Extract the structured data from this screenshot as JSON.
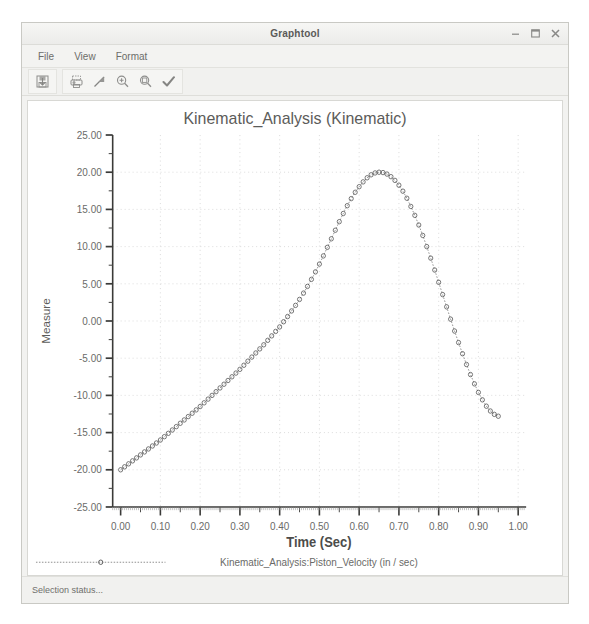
{
  "window": {
    "title": "Graphtool",
    "controls": [
      {
        "name": "minimize-button",
        "icon": "minimize-icon"
      },
      {
        "name": "maximize-button",
        "icon": "maximize-icon"
      },
      {
        "name": "close-button",
        "icon": "close-icon"
      }
    ]
  },
  "menubar": {
    "items": [
      {
        "label": "File"
      },
      {
        "label": "View"
      },
      {
        "label": "Format"
      }
    ]
  },
  "toolbar": {
    "buttons": [
      {
        "name": "save-plot-button",
        "icon": "save-icon"
      },
      {
        "name": "print-button",
        "icon": "printer-icon"
      },
      {
        "name": "trend-line-button",
        "icon": "trend-arrow-icon"
      },
      {
        "name": "zoom-in-button",
        "icon": "zoom-in-icon"
      },
      {
        "name": "zoom-out-button",
        "icon": "zoom-out-icon"
      },
      {
        "name": "apply-button",
        "icon": "checkmark-icon"
      }
    ]
  },
  "statusbar": {
    "text": "Selection status..."
  },
  "chart_data": {
    "type": "scatter",
    "title": "Kinematic_Analysis (Kinematic)",
    "xlabel": "Time (Sec)",
    "ylabel": "Measure",
    "xlim": [
      -0.02,
      1.02
    ],
    "ylim": [
      -25.0,
      25.0
    ],
    "xticks": [
      "0.00",
      "0.10",
      "0.20",
      "0.30",
      "0.40",
      "0.50",
      "0.60",
      "0.70",
      "0.80",
      "0.90",
      "1.00"
    ],
    "xtick_values": [
      0.0,
      0.1,
      0.2,
      0.3,
      0.4,
      0.5,
      0.6,
      0.7,
      0.8,
      0.9,
      1.0
    ],
    "yticks": [
      "25.00",
      "20.00",
      "15.00",
      "10.00",
      "5.00",
      "0.00",
      "-5.00",
      "-10.00",
      "-15.00",
      "-20.00",
      "-25.00"
    ],
    "ytick_values": [
      25,
      20,
      15,
      10,
      5,
      0,
      -5,
      -10,
      -15,
      -20,
      -25
    ],
    "grid": true,
    "minor_ticks": true,
    "legend_position": "bottom",
    "legend": [
      {
        "label": "Kinematic_Analysis:Piston_Velocity (in / sec)",
        "marker": "circle",
        "linestyle": "dotted",
        "color": "#555555"
      }
    ],
    "series": [
      {
        "name": "Kinematic_Analysis:Piston_Velocity (in / sec)",
        "marker": "circle",
        "color": "#555555",
        "x": [
          0.0,
          0.01,
          0.02,
          0.03,
          0.04,
          0.05,
          0.06,
          0.07,
          0.08,
          0.09,
          0.1,
          0.11,
          0.12,
          0.13,
          0.14,
          0.15,
          0.16,
          0.17,
          0.18,
          0.19,
          0.2,
          0.21,
          0.22,
          0.23,
          0.24,
          0.25,
          0.26,
          0.27,
          0.28,
          0.29,
          0.3,
          0.31,
          0.32,
          0.33,
          0.34,
          0.35,
          0.36,
          0.37,
          0.38,
          0.39,
          0.4,
          0.41,
          0.42,
          0.43,
          0.44,
          0.45,
          0.46,
          0.47,
          0.48,
          0.49,
          0.5,
          0.51,
          0.52,
          0.53,
          0.54,
          0.55,
          0.56,
          0.57,
          0.58,
          0.59,
          0.6,
          0.61,
          0.62,
          0.63,
          0.64,
          0.65,
          0.66,
          0.67,
          0.68,
          0.69,
          0.7,
          0.71,
          0.72,
          0.73,
          0.74,
          0.75,
          0.76,
          0.77,
          0.78,
          0.79,
          0.8,
          0.81,
          0.82,
          0.83,
          0.84,
          0.85,
          0.86,
          0.87,
          0.88,
          0.89,
          0.9,
          0.91,
          0.92,
          0.93,
          0.94,
          0.95
        ],
        "y": [
          -20.0,
          -19.6,
          -19.2,
          -18.8,
          -18.4,
          -18.0,
          -17.6,
          -17.2,
          -16.8,
          -16.4,
          -16.0,
          -15.55,
          -15.1,
          -14.65,
          -14.2,
          -13.75,
          -13.3,
          -12.85,
          -12.4,
          -11.95,
          -11.5,
          -11.0,
          -10.5,
          -10.0,
          -9.5,
          -9.0,
          -8.5,
          -8.0,
          -7.5,
          -7.0,
          -6.5,
          -5.95,
          -5.4,
          -4.85,
          -4.3,
          -3.75,
          -3.2,
          -2.6,
          -2.0,
          -1.4,
          -0.8,
          -0.1,
          0.6,
          1.35,
          2.1,
          2.9,
          3.75,
          4.65,
          5.6,
          6.6,
          7.65,
          8.75,
          9.9,
          11.05,
          12.2,
          13.35,
          14.45,
          15.5,
          16.45,
          17.3,
          18.05,
          18.7,
          19.25,
          19.65,
          19.9,
          20.0,
          19.95,
          19.75,
          19.4,
          18.9,
          18.25,
          17.45,
          16.5,
          15.4,
          14.2,
          12.9,
          11.5,
          10.0,
          8.45,
          6.85,
          5.2,
          3.55,
          1.9,
          0.25,
          -1.35,
          -2.9,
          -4.4,
          -5.85,
          -7.2,
          -8.45,
          -9.6,
          -10.6,
          -11.45,
          -12.1,
          -12.55,
          -12.8
        ]
      }
    ]
  }
}
